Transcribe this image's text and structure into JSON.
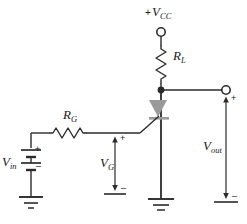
{
  "figure": {
    "type": "schematic-diagram",
    "width": 247,
    "height": 224,
    "background_color": "#ffffff",
    "wire_color": "#2b2b2b",
    "device_fill_color": "#9a9a9a",
    "text_color": "#1a1a1a"
  },
  "labels": {
    "vcc": {
      "sign": "+",
      "symbol": "V",
      "subscript": "CC",
      "full": "+VCC"
    },
    "rl": {
      "symbol": "R",
      "subscript": "L",
      "full": "RL"
    },
    "rg": {
      "symbol": "R",
      "subscript": "G",
      "full": "RG"
    },
    "vg": {
      "symbol": "V",
      "subscript": "G",
      "full": "VG"
    },
    "vin": {
      "symbol": "V",
      "subscript": "in",
      "full": "Vin"
    },
    "vout": {
      "symbol": "V",
      "subscript": "out",
      "full": "Vout"
    }
  },
  "polarity": {
    "plus": "+",
    "minus": "–",
    "vin_plus": "+",
    "vin_minus": "–",
    "vg_plus": "+",
    "vg_minus": "–",
    "vout_plus": "+",
    "vout_minus": "–"
  },
  "components": [
    {
      "name": "vcc-terminal",
      "kind": "open-terminal",
      "label": "+VCC"
    },
    {
      "name": "load-resistor",
      "kind": "resistor",
      "orientation": "vertical",
      "label": "RL"
    },
    {
      "name": "gate-resistor",
      "kind": "resistor",
      "orientation": "horizontal",
      "label": "RG"
    },
    {
      "name": "jfet-transistor",
      "kind": "jfet-n-channel",
      "label": ""
    },
    {
      "name": "input-battery",
      "kind": "battery",
      "cells": 2,
      "label": "Vin"
    },
    {
      "name": "output-terminal",
      "kind": "open-terminal",
      "label": "Vout"
    },
    {
      "name": "gate-voltage-arrow",
      "kind": "voltage-arrow",
      "label": "VG"
    },
    {
      "name": "output-voltage-arrow",
      "kind": "voltage-arrow",
      "label": "Vout"
    },
    {
      "name": "source-ground",
      "kind": "ground",
      "bars": 3
    },
    {
      "name": "input-ground",
      "kind": "ground",
      "bars": 3
    }
  ]
}
